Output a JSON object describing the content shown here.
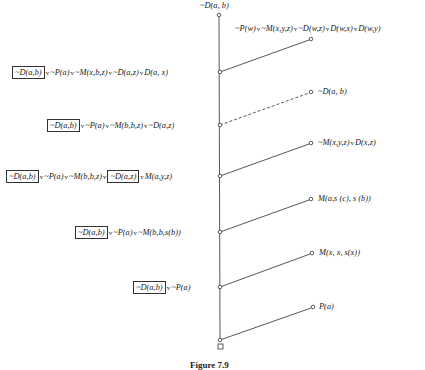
{
  "diagram": {
    "type": "resolution-refutation-tree",
    "caption": "Figure 7.9",
    "root_label": "~D(a, b)",
    "empty_clause_symbol": "□",
    "left_nodes": [
      {
        "id": "L1",
        "parts": [
          {
            "boxed": true,
            "text": "~D(a,b)"
          },
          {
            "op": "v"
          },
          {
            "text": "~P(a)"
          },
          {
            "op": "v"
          },
          {
            "text": "~M(x,b,z)"
          },
          {
            "op": "v"
          },
          {
            "text": "~D(a,z)"
          },
          {
            "op": "v"
          },
          {
            "text": "D(a, x)"
          }
        ]
      },
      {
        "id": "L2",
        "parts": [
          {
            "boxed": true,
            "text": "~D(a,b)"
          },
          {
            "op": "v"
          },
          {
            "text": "~P(a)"
          },
          {
            "op": "v"
          },
          {
            "text": "~M(b,b,z)"
          },
          {
            "op": "v"
          },
          {
            "text": "~D(a,z)"
          }
        ]
      },
      {
        "id": "L3",
        "parts": [
          {
            "boxed": true,
            "text": "~D(a,b)"
          },
          {
            "op": "v"
          },
          {
            "text": "~P(a)"
          },
          {
            "op": "v"
          },
          {
            "text": "~M(b,b,z)"
          },
          {
            "op": "v"
          },
          {
            "boxed": true,
            "text": "~D(a,z)"
          },
          {
            "op": "v"
          },
          {
            "text": "M(a,y,z)"
          }
        ]
      },
      {
        "id": "L4",
        "parts": [
          {
            "boxed": true,
            "text": "~D(a,b)"
          },
          {
            "op": "v"
          },
          {
            "text": "~P(a)"
          },
          {
            "op": "v"
          },
          {
            "text": "~M(b,b,s(b))"
          }
        ]
      },
      {
        "id": "L5",
        "parts": [
          {
            "boxed": true,
            "text": "~D(a,b)"
          },
          {
            "op": "v"
          },
          {
            "text": "~P(a)"
          }
        ]
      }
    ],
    "right_nodes": [
      {
        "id": "R1",
        "text": "~P(w) v ~M(x,y,z) v ~D(w,z) v D(w,x) v D(w,y)",
        "dashed": false
      },
      {
        "id": "R2",
        "text": "~D(a, b)",
        "dashed": true
      },
      {
        "id": "R3",
        "text": "~M(x,y,z) v D(x,z)",
        "dashed": false
      },
      {
        "id": "R4",
        "text": "M(a,s (c), s (b))",
        "dashed": false
      },
      {
        "id": "R5",
        "text": "M(x, x, s(x))",
        "dashed": false
      },
      {
        "id": "R6",
        "text": "P(a)",
        "dashed": false
      }
    ],
    "labels": {
      "root": "~D(a, b)",
      "r1": "~P(w)",
      "r1b": "~M(x,y,z)",
      "r1c": "~D(w,z)",
      "r1d": "D(w,x)",
      "r1e": "D(w,y)",
      "r2": "~D(a, b)",
      "r3a": "~M(x,y,z)",
      "r3b": "D(x,z)",
      "r4": "M(a,s (c), s (b))",
      "r5": "M(x, x, s(x))",
      "r6": "P(a)",
      "or": "v",
      "l_boxed": "~D(a,b)",
      "l_paz": "~D(a,z)",
      "l1a": "~P(a)",
      "l1b": "~M(x,b,z)",
      "l1c": "~D(a,z)",
      "l1d": "D(a, x)",
      "l2a": "~P(a)",
      "l2b": "~M(b,b,z)",
      "l2c": "~D(a,z)",
      "l3a": "~P(a)",
      "l3b": "~M(b,b,z)",
      "l3d": "M(a,y,z)",
      "l4a": "~P(a)",
      "l4b": "~M(b,b,s(b))",
      "l5a": "~P(a)",
      "caption": "Figure 7.9"
    }
  }
}
